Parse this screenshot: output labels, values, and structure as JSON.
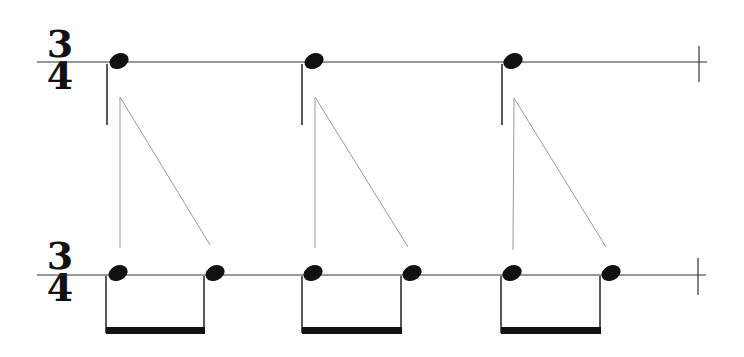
{
  "diagram": {
    "colors": {
      "ink": "#111111",
      "guide_line": "#9a9a9a",
      "background": "#ffffff"
    },
    "top_staff": {
      "time_signature": {
        "numerator": "3",
        "denominator": "4"
      },
      "notes": [
        {
          "type": "quarter",
          "x": 118
        },
        {
          "type": "quarter",
          "x": 313
        },
        {
          "type": "quarter",
          "x": 513
        }
      ],
      "barline": true
    },
    "bottom_staff": {
      "time_signature": {
        "numerator": "3",
        "denominator": "4"
      },
      "groups": [
        {
          "type": "beamed-eighths",
          "notes_x": [
            117,
            215
          ]
        },
        {
          "type": "beamed-eighths",
          "notes_x": [
            312,
            410
          ]
        },
        {
          "type": "beamed-eighths",
          "notes_x": [
            512,
            610
          ]
        }
      ],
      "barline": true
    },
    "mappings": [
      {
        "from_note": 0,
        "to_group": 0
      },
      {
        "from_note": 1,
        "to_group": 1
      },
      {
        "from_note": 2,
        "to_group": 2
      }
    ]
  }
}
